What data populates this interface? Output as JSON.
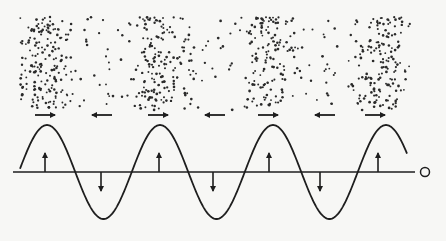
{
  "diagram": {
    "colors": {
      "background": "#f7f7f5",
      "ink": "#1e1e1e",
      "dot": "#2a2a2a"
    },
    "particle_field": {
      "x_start": 20,
      "x_end": 410,
      "y_top": 17,
      "y_bottom": 110,
      "compression_centers_x": [
        45,
        158,
        268,
        380
      ],
      "rarefaction_centers_x": [
        102,
        213,
        323
      ]
    },
    "displacement_arrows": {
      "y": 115,
      "items": [
        {
          "x": 45,
          "direction": "right"
        },
        {
          "x": 102,
          "direction": "left"
        },
        {
          "x": 158,
          "direction": "right"
        },
        {
          "x": 215,
          "direction": "left"
        },
        {
          "x": 268,
          "direction": "right"
        },
        {
          "x": 325,
          "direction": "left"
        },
        {
          "x": 375,
          "direction": "right"
        }
      ]
    },
    "axis": {
      "y": 172,
      "x_start": 13,
      "x_end": 415,
      "end_marker": "O"
    },
    "sine_wave": {
      "x_start": 20,
      "x_end": 407,
      "amplitude": 47,
      "period": 113,
      "first_peak_x": 47
    },
    "vertical_arrows": [
      {
        "x": 45,
        "direction": "up"
      },
      {
        "x": 101,
        "direction": "down"
      },
      {
        "x": 159,
        "direction": "up"
      },
      {
        "x": 213,
        "direction": "down"
      },
      {
        "x": 269,
        "direction": "up"
      },
      {
        "x": 320,
        "direction": "down"
      },
      {
        "x": 378,
        "direction": "up"
      }
    ]
  }
}
